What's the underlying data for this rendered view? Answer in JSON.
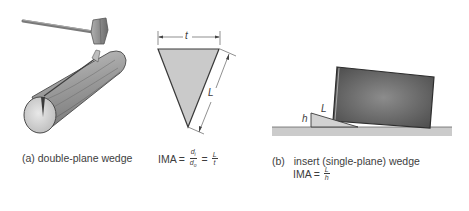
{
  "figure_a": {
    "caption": "(a) double-plane wedge",
    "formula": {
      "lhs": "IMA",
      "eq1": "=",
      "frac1_num": "d",
      "frac1_num_sub": "i",
      "frac1_den": "d",
      "frac1_den_sub": "o",
      "eq2": "=",
      "frac2_num": "L",
      "frac2_den": "t"
    },
    "dimension_labels": {
      "top": "t",
      "side": "L"
    }
  },
  "figure_b": {
    "caption_prefix": "(b)",
    "caption": "insert (single-plane) wedge",
    "formula": {
      "lhs": "IMA",
      "eq1": "=",
      "frac_num": "L",
      "frac_den": "h"
    },
    "dimension_labels": {
      "height": "h",
      "length": "L"
    }
  },
  "colors": {
    "wedge_fill": "#c8c8c8",
    "block_fill": "#6e6e6e",
    "ground_fill": "#c9c9c9",
    "log_fill": "#9a9a9a",
    "text": "#3d3d3d"
  }
}
